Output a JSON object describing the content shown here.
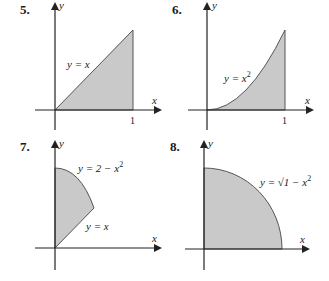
{
  "figures": [
    {
      "number": "5.",
      "curve_label": "y = x",
      "x_axis": "x",
      "y_axis": "y",
      "tick": "1"
    },
    {
      "number": "6.",
      "curve_label": "y = x",
      "curve_sup": "2",
      "x_axis": "x",
      "y_axis": "y",
      "tick": "1"
    },
    {
      "number": "7.",
      "curve_label_top": "y = 2 − x",
      "curve_sup_top": "2",
      "curve_label_bottom": "y = x",
      "x_axis": "x",
      "y_axis": "y"
    },
    {
      "number": "8.",
      "curve_label": "y = √1 − x",
      "curve_sup": "2",
      "x_axis": "x",
      "y_axis": "y"
    }
  ],
  "colors": {
    "shade": "#c9c9c9",
    "axis": "#222222"
  }
}
